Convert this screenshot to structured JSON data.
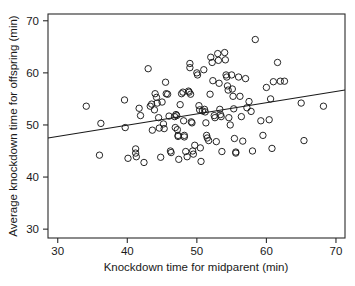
{
  "chart_data": {
    "type": "scatter",
    "title": "",
    "subtitle": "",
    "xlabel": "Knockdown time for midparent (min)",
    "ylabel": "Average knockdown time for offspring (min)",
    "xlim": [
      28.6,
      71.3
    ],
    "ylim": [
      28.3,
      71.3
    ],
    "xticks": [
      30,
      40,
      50,
      60,
      70
    ],
    "yticks": [
      30,
      40,
      50,
      60,
      70
    ],
    "xtick_labels": [
      "30",
      "40",
      "50",
      "60",
      "70"
    ],
    "ytick_labels": [
      "30",
      "40",
      "50",
      "60",
      "70"
    ],
    "grid": false,
    "legend": null,
    "marker": "open-circle",
    "marker_size": 3.2,
    "point_color": "#1a1a1a",
    "line_color": "#1a1a1a",
    "background_color": "#ffffff",
    "annotations": [],
    "trendline": {
      "type": "linear-regression",
      "label": "",
      "slope": 0.2155,
      "intercept": 41.34,
      "x_start": 28.6,
      "y_start": 47.5,
      "x_end": 71.3,
      "y_end": 56.7
    },
    "points": [
      [
        34.1,
        53.6
      ],
      [
        36.2,
        50.3
      ],
      [
        36.0,
        44.2
      ],
      [
        39.6,
        54.8
      ],
      [
        39.7,
        49.5
      ],
      [
        40.1,
        43.6
      ],
      [
        41.2,
        45.4
      ],
      [
        41.2,
        44.6
      ],
      [
        41.3,
        43.9
      ],
      [
        41.7,
        53.2
      ],
      [
        41.9,
        51.8
      ],
      [
        42.4,
        42.8
      ],
      [
        43.0,
        60.8
      ],
      [
        43.3,
        53.6
      ],
      [
        43.5,
        54.0
      ],
      [
        43.6,
        49.0
      ],
      [
        43.9,
        52.9
      ],
      [
        44.0,
        56.0
      ],
      [
        44.2,
        55.3
      ],
      [
        44.3,
        54.2
      ],
      [
        44.5,
        51.4
      ],
      [
        44.6,
        49.4
      ],
      [
        44.8,
        43.8
      ],
      [
        45.0,
        54.4
      ],
      [
        45.2,
        50.2
      ],
      [
        45.3,
        49.3
      ],
      [
        45.5,
        58.2
      ],
      [
        45.6,
        56.0
      ],
      [
        45.8,
        55.9
      ],
      [
        46.0,
        51.7
      ],
      [
        46.2,
        45.0
      ],
      [
        46.3,
        44.7
      ],
      [
        46.8,
        51.6
      ],
      [
        46.9,
        49.5
      ],
      [
        47.0,
        52.0
      ],
      [
        47.1,
        51.8
      ],
      [
        47.2,
        49.1
      ],
      [
        47.3,
        48.0
      ],
      [
        47.3,
        47.8
      ],
      [
        47.4,
        43.4
      ],
      [
        47.6,
        53.9
      ],
      [
        47.8,
        56.0
      ],
      [
        48.0,
        56.3
      ],
      [
        48.1,
        50.8
      ],
      [
        48.2,
        48.0
      ],
      [
        48.2,
        47.7
      ],
      [
        48.4,
        44.9
      ],
      [
        48.6,
        43.9
      ],
      [
        48.8,
        56.5
      ],
      [
        48.9,
        56.3
      ],
      [
        49.0,
        61.8
      ],
      [
        49.0,
        61.0
      ],
      [
        49.1,
        55.9
      ],
      [
        49.2,
        50.6
      ],
      [
        49.3,
        50.4
      ],
      [
        49.4,
        45.0
      ],
      [
        49.5,
        44.4
      ],
      [
        49.7,
        46.1
      ],
      [
        50.0,
        60.0
      ],
      [
        50.1,
        59.6
      ],
      [
        50.3,
        53.7
      ],
      [
        50.4,
        52.9
      ],
      [
        50.5,
        45.6
      ],
      [
        50.6,
        43.0
      ],
      [
        50.8,
        52.7
      ],
      [
        51.0,
        60.6
      ],
      [
        51.1,
        53.0
      ],
      [
        51.2,
        52.5
      ],
      [
        51.3,
        50.4
      ],
      [
        51.4,
        48.0
      ],
      [
        51.5,
        47.5
      ],
      [
        51.7,
        47.0
      ],
      [
        51.9,
        55.9
      ],
      [
        52.0,
        63.0
      ],
      [
        52.2,
        62.0
      ],
      [
        52.3,
        58.5
      ],
      [
        52.5,
        51.8
      ],
      [
        52.6,
        51.4
      ],
      [
        52.8,
        46.8
      ],
      [
        53.0,
        63.7
      ],
      [
        53.1,
        62.4
      ],
      [
        53.2,
        58.0
      ],
      [
        53.3,
        53.0
      ],
      [
        53.4,
        52.0
      ],
      [
        53.5,
        51.6
      ],
      [
        53.6,
        44.9
      ],
      [
        54.0,
        63.9
      ],
      [
        54.1,
        62.5
      ],
      [
        54.2,
        59.6
      ],
      [
        54.3,
        59.2
      ],
      [
        54.4,
        57.5
      ],
      [
        54.5,
        56.7
      ],
      [
        54.6,
        51.4
      ],
      [
        54.8,
        50.0
      ],
      [
        55.0,
        59.6
      ],
      [
        55.1,
        56.9
      ],
      [
        55.2,
        55.5
      ],
      [
        55.3,
        53.1
      ],
      [
        55.4,
        47.4
      ],
      [
        55.6,
        44.8
      ],
      [
        55.6,
        44.6
      ],
      [
        56.0,
        59.2
      ],
      [
        56.2,
        55.5
      ],
      [
        56.4,
        51.6
      ],
      [
        56.6,
        46.9
      ],
      [
        57.0,
        58.9
      ],
      [
        57.2,
        53.3
      ],
      [
        57.5,
        54.5
      ],
      [
        57.8,
        52.6
      ],
      [
        58.0,
        45.0
      ],
      [
        58.4,
        66.4
      ],
      [
        59.2,
        50.8
      ],
      [
        59.5,
        48.0
      ],
      [
        60.0,
        57.2
      ],
      [
        60.4,
        51.0
      ],
      [
        60.6,
        55.0
      ],
      [
        60.8,
        45.5
      ],
      [
        61.0,
        58.3
      ],
      [
        61.6,
        62.0
      ],
      [
        62.0,
        58.4
      ],
      [
        62.6,
        58.4
      ],
      [
        65.0,
        54.2
      ],
      [
        65.4,
        47.0
      ],
      [
        68.2,
        53.6
      ]
    ]
  }
}
